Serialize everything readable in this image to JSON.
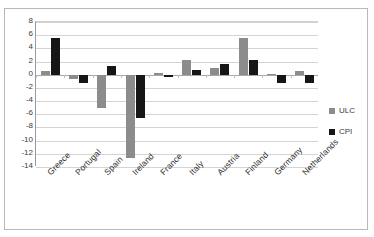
{
  "chart_data": {
    "type": "bar",
    "title": "",
    "subtitle": "",
    "xlabel": "",
    "ylabel": "",
    "ylim": [
      -14,
      8
    ],
    "ytick_step": 2,
    "yticks": [
      8,
      6,
      4,
      2,
      0,
      -2,
      -4,
      -6,
      -8,
      -10,
      -12,
      -14
    ],
    "grid": true,
    "legend_position": "right",
    "categories": [
      "Greece",
      "Portugal",
      "Spain",
      "Ireland",
      "France",
      "Italy",
      "Austria",
      "Finland",
      "Germany",
      "Netherlands"
    ],
    "series": [
      {
        "name": "ULC",
        "color": "#8c8c8c",
        "values": [
          0.6,
          -0.7,
          -5.0,
          -12.6,
          0.3,
          2.3,
          1.0,
          5.5,
          0.1,
          0.6
        ]
      },
      {
        "name": "CPI",
        "color": "#161616",
        "values": [
          5.5,
          -1.3,
          1.4,
          -6.5,
          -0.4,
          0.7,
          1.6,
          2.2,
          -1.2,
          -1.3
        ]
      }
    ]
  },
  "legend": {
    "items": [
      {
        "label": "ULC",
        "swatch": "gray-square-icon"
      },
      {
        "label": "CPI",
        "swatch": "black-square-icon"
      }
    ]
  }
}
